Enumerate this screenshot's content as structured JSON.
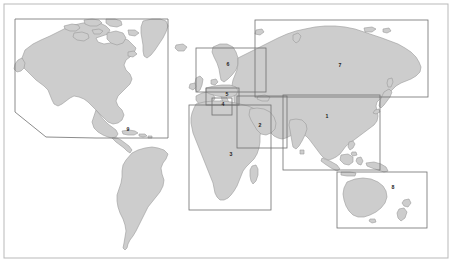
{
  "figure": {
    "kind": "world-map-region-index",
    "width": 453,
    "height": 265,
    "background_color": "#ffffff",
    "land_fill_color": "#cdcdcd",
    "land_stroke_color": "#9a9a9a",
    "region_box_color": "#6f6f6f",
    "frame_color": "#b9b9b9"
  },
  "frame": {
    "x": 4,
    "y": 4,
    "width": 444,
    "height": 254
  },
  "regions": [
    {
      "label": "1",
      "name": "asia-east-south",
      "shape": "rect",
      "x": 283,
      "y": 95,
      "width": 97,
      "height": 75,
      "label_x": 327,
      "label_y": 117
    },
    {
      "label": "2",
      "name": "middle-east",
      "shape": "rect",
      "x": 237,
      "y": 96,
      "width": 50,
      "height": 52,
      "label_x": 260,
      "label_y": 126
    },
    {
      "label": "3",
      "name": "africa",
      "shape": "rect",
      "x": 189,
      "y": 105,
      "width": 82,
      "height": 105,
      "label_x": 231,
      "label_y": 155
    },
    {
      "label": "4",
      "name": "southern-western-europe",
      "shape": "rect",
      "x": 212,
      "y": 98,
      "width": 20,
      "height": 17,
      "label_x": 223,
      "label_y": 105
    },
    {
      "label": "5",
      "name": "central-europe",
      "shape": "rect",
      "x": 206,
      "y": 88,
      "width": 33,
      "height": 17,
      "label_x": 227,
      "label_y": 95
    },
    {
      "label": "6",
      "name": "northern-europe",
      "shape": "rect",
      "x": 196,
      "y": 48,
      "width": 70,
      "height": 44,
      "label_x": 228,
      "label_y": 65
    },
    {
      "label": "7",
      "name": "russia-north-asia",
      "shape": "rect",
      "x": 255,
      "y": 20,
      "width": 173,
      "height": 77,
      "label_x": 340,
      "label_y": 66
    },
    {
      "label": "8",
      "name": "oceania",
      "shape": "rect",
      "x": 337,
      "y": 172,
      "width": 90,
      "height": 56,
      "label_x": 393,
      "label_y": 188
    },
    {
      "label": "9",
      "name": "americas",
      "shape": "polygon",
      "points": "15,19 168,19 168,138 96,138 46,137 15,112",
      "label_x": 128,
      "label_y": 130
    }
  ],
  "landmasses": [
    {
      "name": "north-america",
      "label": "North America"
    },
    {
      "name": "south-america",
      "label": "South America"
    },
    {
      "name": "greenland",
      "label": "Greenland"
    },
    {
      "name": "iceland",
      "label": "Iceland"
    },
    {
      "name": "europe",
      "label": "Europe"
    },
    {
      "name": "africa",
      "label": "Africa"
    },
    {
      "name": "madagascar",
      "label": "Madagascar"
    },
    {
      "name": "asia-eurasia",
      "label": "Eurasia"
    },
    {
      "name": "arabian-peninsula",
      "label": "Arabian Peninsula"
    },
    {
      "name": "india",
      "label": "India"
    },
    {
      "name": "japan",
      "label": "Japan"
    },
    {
      "name": "indonesia",
      "label": "Indonesia"
    },
    {
      "name": "philippines",
      "label": "Philippines"
    },
    {
      "name": "australia",
      "label": "Australia"
    },
    {
      "name": "new-zealand",
      "label": "New Zealand"
    },
    {
      "name": "new-guinea",
      "label": "New Guinea"
    },
    {
      "name": "british-isles",
      "label": "British Isles"
    },
    {
      "name": "scandinavia",
      "label": "Scandinavia"
    }
  ]
}
